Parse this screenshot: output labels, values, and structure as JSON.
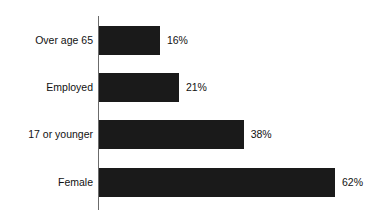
{
  "chart_data": {
    "type": "bar",
    "orientation": "horizontal",
    "title": "",
    "subtitle": "",
    "xlabel": "",
    "ylabel": "",
    "categories": [
      "Over age 65",
      "Employed",
      "17 or younger",
      "Female"
    ],
    "values": [
      16,
      21,
      38,
      62
    ],
    "value_labels": [
      "16%",
      "21%",
      "38%",
      "62%"
    ],
    "value_suffix": "%",
    "xlim": [
      0,
      62
    ],
    "grid": false,
    "legend": false,
    "legend_position": "none",
    "axis_line": "category-axis-vertical",
    "colors": {
      "bar": "#1a1a1a",
      "axis": "#6b6b6b",
      "text": "#111111",
      "background": "#ffffff"
    },
    "bars": [
      {
        "category": "Over age 65",
        "value": 16,
        "label": "16%"
      },
      {
        "category": "Employed",
        "value": 21,
        "label": "21%"
      },
      {
        "category": "17 or younger",
        "value": 38,
        "label": "38%"
      },
      {
        "category": "Female",
        "value": 62,
        "label": "62%"
      }
    ]
  }
}
